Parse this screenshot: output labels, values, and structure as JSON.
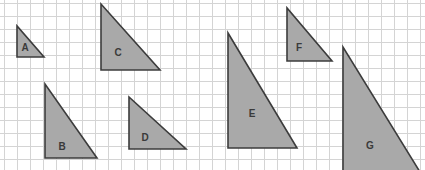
{
  "figure": {
    "width": 425,
    "height": 170,
    "background_color": "#ffffff"
  },
  "grid": {
    "name": "square-grid",
    "cell_size": 13,
    "origin_x": 4,
    "origin_y": 3,
    "columns": 32,
    "rows": 13,
    "line_color": "#d4d4d4",
    "line_width": 1,
    "visible": true
  },
  "style": {
    "shape_fill": "#a9a9a9",
    "shape_stroke": "#3c3c3c",
    "shape_stroke_width": 1.6,
    "label_color": "#3a3a3a",
    "label_font_size": 10
  },
  "shapes": [
    {
      "id": "triangle-a",
      "label": "A",
      "type": "right-triangle",
      "orientation": "right-angle-bottom-left",
      "points": "17,26 17,57 44,57",
      "label_x": 25,
      "label_y": 48,
      "base_cells": 2,
      "height_cells": 2.5
    },
    {
      "id": "triangle-c",
      "label": "C",
      "type": "right-triangle",
      "orientation": "right-angle-bottom-left",
      "points": "101,4 101,70 160,70",
      "label_x": 118,
      "label_y": 53,
      "base_cells": 4.5,
      "height_cells": 5
    },
    {
      "id": "triangle-b",
      "label": "B",
      "type": "right-triangle",
      "orientation": "right-angle-bottom-left",
      "points": "45,84 45,158 97,158",
      "label_x": 62,
      "label_y": 147,
      "base_cells": 4,
      "height_cells": 5.5
    },
    {
      "id": "triangle-d",
      "label": "D",
      "type": "right-triangle",
      "orientation": "right-angle-bottom-left",
      "points": "129,97 129,149 186,149",
      "label_x": 145,
      "label_y": 138,
      "base_cells": 4.5,
      "height_cells": 4
    },
    {
      "id": "triangle-e",
      "label": "E",
      "type": "right-triangle",
      "orientation": "right-angle-bottom-left",
      "points": "228,33 228,148 297,148",
      "label_x": 252,
      "label_y": 114,
      "base_cells": 5.5,
      "height_cells": 9
    },
    {
      "id": "triangle-f",
      "label": "F",
      "type": "right-triangle",
      "orientation": "right-angle-bottom-left",
      "points": "287,8 287,61 332,61",
      "label_x": 299,
      "label_y": 48,
      "base_cells": 3.5,
      "height_cells": 4
    },
    {
      "id": "triangle-g",
      "label": "G",
      "type": "right-triangle",
      "orientation": "right-angle-bottom-left",
      "points": "343,47 343,172 420,172",
      "label_x": 370,
      "label_y": 146,
      "base_cells": 6,
      "height_cells": 9.5
    }
  ]
}
